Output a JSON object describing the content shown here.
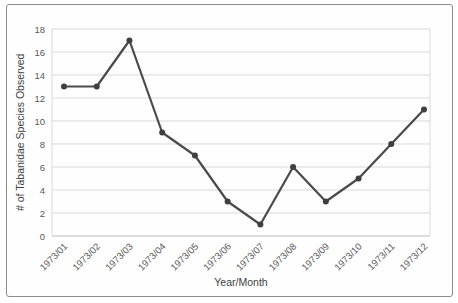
{
  "chart_data": {
    "type": "line",
    "title": "",
    "x": [
      "1973/01",
      "1973/02",
      "1973/03",
      "1973/04",
      "1973/05",
      "1973/06",
      "1973/07",
      "1973/08",
      "1973/09",
      "1973/10",
      "1973/11",
      "1973/12"
    ],
    "values": [
      13,
      13,
      17,
      9,
      7,
      3,
      1,
      6,
      3,
      5,
      8,
      11
    ],
    "xlabel": "Year/Month",
    "ylabel": "# of Tabanidae Species Observed",
    "ylim": [
      0,
      18
    ],
    "ytick_step": 2,
    "grid": "horizontal",
    "legend": "none",
    "marker": "circle",
    "colors": {
      "line": "#4a4a4a",
      "marker": "#3f3f3f",
      "gridline": "#d9d9d9",
      "baseline": "#bfbfbf",
      "tick_text": "#595959",
      "axis_title_text": "#3f3f3f",
      "frame_border": "#8a8a8a",
      "background": "#ffffff"
    }
  }
}
